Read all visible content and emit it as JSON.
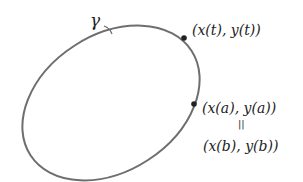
{
  "diagram": {
    "curve_label": "γ",
    "point_t_label": "(x(t), y(t))",
    "point_a_label": "(x(a), y(a))",
    "equals_label": "||",
    "point_b_label": "(x(b), y(b))",
    "colors": {
      "curve": "#6e6e6e",
      "point": "#222222",
      "text": "#222222"
    }
  }
}
